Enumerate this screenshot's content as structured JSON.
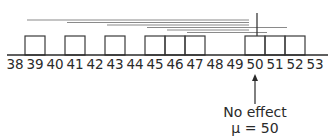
{
  "diagram": {
    "axis": {
      "min": 38,
      "max": 53,
      "labels": [
        "38",
        "39",
        "40",
        "41",
        "42",
        "43",
        "44",
        "45",
        "46",
        "47",
        "48",
        "49",
        "50",
        "51",
        "52",
        "53"
      ]
    },
    "observations": [
      39,
      41,
      43,
      45,
      46,
      47,
      50,
      51,
      52
    ],
    "intervals": [
      {
        "from": 38.6,
        "to": 49.7
      },
      {
        "from": 40.6,
        "to": 49.7
      },
      {
        "from": 42.6,
        "to": 49.7
      },
      {
        "from": 44.6,
        "to": 51.6
      },
      {
        "from": 45.6,
        "to": 49.7
      },
      {
        "from": 46.6,
        "to": 50.6
      }
    ],
    "reference_line_value": 50,
    "annotation": {
      "value": 50,
      "line1": "No effect",
      "line2": "μ = 50"
    },
    "colors": {
      "ink": "#2a2a2a",
      "interval_line": "#8a8a8a",
      "box_stroke": "#3a3a3a"
    }
  }
}
